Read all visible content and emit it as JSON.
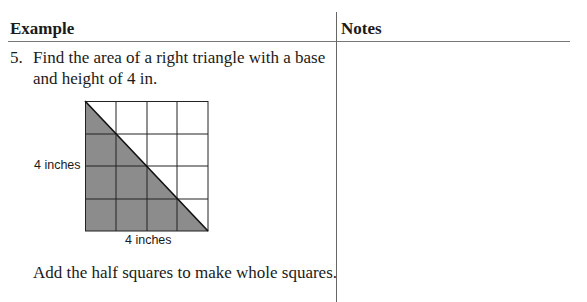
{
  "table": {
    "headers": [
      "Example",
      "Notes"
    ]
  },
  "example": {
    "number": "5.",
    "question": "Find the area of a right triangle with a base and height of 4 in.",
    "figure": {
      "grid_size": 4,
      "left_label": "4 inches",
      "bottom_label": "4 inches",
      "shading_color": "#8c8c8c"
    },
    "hint": "Add the half squares to make whole squares."
  }
}
